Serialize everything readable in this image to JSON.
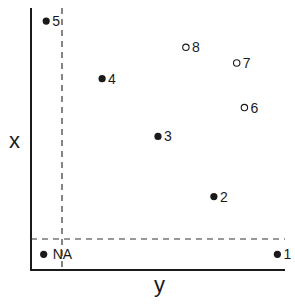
{
  "chart_data": {
    "type": "scatter",
    "title": "",
    "xlabel": "y",
    "ylabel": "x",
    "grid": false,
    "legend": null,
    "axis_ticks": "none",
    "reference_lines": {
      "vertical_dashed": "separates NA (missing x) region on the left",
      "horizontal_dashed": "separates NA (missing y) region at the bottom"
    },
    "points": [
      {
        "label": "1",
        "x": 0.97,
        "y": 0.06,
        "marker": "filled",
        "region": "bottom-NA strip"
      },
      {
        "label": "2",
        "x": 0.72,
        "y": 0.28,
        "marker": "filled"
      },
      {
        "label": "3",
        "x": 0.5,
        "y": 0.51,
        "marker": "filled"
      },
      {
        "label": "4",
        "x": 0.28,
        "y": 0.73,
        "marker": "filled"
      },
      {
        "label": "5",
        "x": 0.06,
        "y": 0.95,
        "marker": "filled",
        "region": "left-NA strip"
      },
      {
        "label": "6",
        "x": 0.84,
        "y": 0.62,
        "marker": "open"
      },
      {
        "label": "7",
        "x": 0.81,
        "y": 0.79,
        "marker": "open"
      },
      {
        "label": "8",
        "x": 0.61,
        "y": 0.85,
        "marker": "open"
      },
      {
        "label": "NA",
        "x": 0.05,
        "y": 0.06,
        "marker": "filled",
        "region": "NA corner"
      }
    ]
  },
  "labels": {
    "x_axis": "y",
    "y_axis": "x"
  },
  "colors": {
    "ink": "#1a1a1a",
    "background": "#ffffff"
  }
}
